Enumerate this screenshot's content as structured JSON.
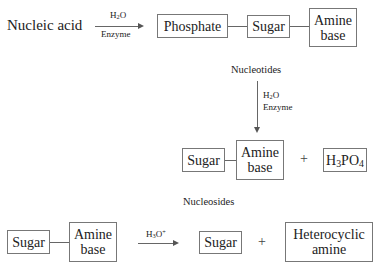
{
  "row1": {
    "start_label": "Nucleic acid",
    "arrow": {
      "above": "H2O",
      "below": "Enzyme"
    },
    "boxes": [
      "Phosphate",
      "Sugar",
      "Amine base"
    ],
    "caption": "Nucleotides"
  },
  "arrow_down": {
    "line1": "H2O",
    "line2": "Enzyme"
  },
  "row2": {
    "boxes": [
      "Sugar",
      "Amine base"
    ],
    "plus": "+",
    "product": "H3PO4",
    "caption": "Nucleosides"
  },
  "row3": {
    "boxes": [
      "Sugar",
      "Amine base"
    ],
    "arrow": {
      "above": "H3O+"
    },
    "product1": "Sugar",
    "plus": "+",
    "product2": "Heterocyclic amine"
  },
  "text_parts": {
    "amine_line1": "Amine",
    "amine_line2": "base",
    "hetero_line1": "Heterocyclic",
    "hetero_line2": "amine",
    "H": "H",
    "O": "O",
    "PO": "PO",
    "sub2": "2",
    "sub3": "3",
    "sub4": "4",
    "plus_sign": "+"
  }
}
